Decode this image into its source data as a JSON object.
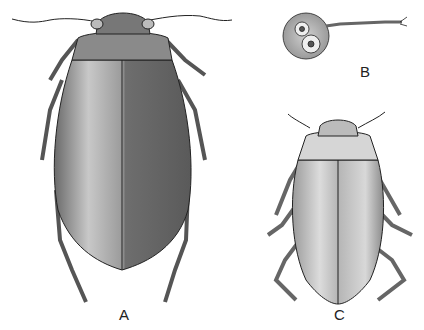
{
  "figure": {
    "labels": {
      "a": "A",
      "b": "B",
      "c": "C"
    },
    "signature_a": "C.W.E.",
    "signature_c": "C.W.E.",
    "colors": {
      "ink": "#222222",
      "shade_dark": "#555555",
      "shade_mid": "#8a8a8a",
      "shade_light": "#cfcfcf",
      "background": "#ffffff"
    }
  }
}
